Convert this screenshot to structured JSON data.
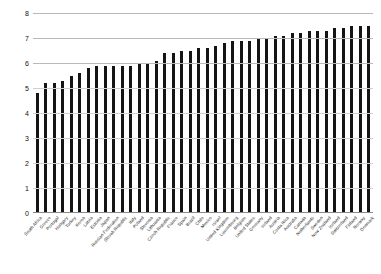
{
  "chart_data": {
    "type": "bar",
    "title": "",
    "xlabel": "",
    "ylabel": "",
    "ylim": [
      0,
      8
    ],
    "yticks": [
      0,
      1,
      2,
      3,
      4,
      5,
      6,
      7,
      8
    ],
    "ytick_labels": [
      "0",
      "1",
      "2",
      "3",
      "4",
      "5",
      "6",
      "7",
      "8"
    ],
    "grid": true,
    "legend": null,
    "bar_color": "#141414",
    "categories": [
      "South Africa",
      "Greece",
      "Portugal",
      "Hungary",
      "Turkey",
      "Korea",
      "Latvia",
      "Estonia",
      "Japan",
      "Russian Federation",
      "Slovak Republic",
      "Italy",
      "Poland",
      "Slovenia",
      "Lithuania",
      "Czech Republic",
      "France",
      "Spain",
      "Brazil",
      "Chile",
      "Mexico",
      "Israel",
      "United Kingdom",
      "Luxembourg",
      "Belgium",
      "United States",
      "Germany",
      "Ireland",
      "Austria",
      "Costa Rica",
      "Australia",
      "Canada",
      "Netherlands",
      "Sweden",
      "New Zealand",
      "Iceland",
      "Switzerland",
      "Finland",
      "Norway",
      "Denmark"
    ],
    "values": [
      4.8,
      5.2,
      5.2,
      5.3,
      5.5,
      5.6,
      5.8,
      5.9,
      5.9,
      5.9,
      5.9,
      5.9,
      6.0,
      6.0,
      6.1,
      6.4,
      6.4,
      6.5,
      6.5,
      6.6,
      6.6,
      6.7,
      6.8,
      6.9,
      6.9,
      6.9,
      7.0,
      7.0,
      7.1,
      7.1,
      7.2,
      7.2,
      7.3,
      7.3,
      7.3,
      7.4,
      7.4,
      7.5,
      7.5,
      7.5
    ]
  }
}
